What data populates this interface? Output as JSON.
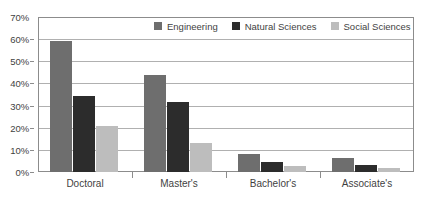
{
  "chart_data": {
    "type": "bar",
    "title": "",
    "subtitle": "",
    "xlabel": "",
    "ylabel": "",
    "categories": [
      "Doctoral",
      "Master's",
      "Bachelor's",
      "Associate's"
    ],
    "series": [
      {
        "name": "Engineering",
        "color": "#6e6e6e",
        "values": [
          59,
          44,
          8,
          6.5
        ]
      },
      {
        "name": "Natural Sciences",
        "color": "#2c2c2c",
        "values": [
          34.5,
          31.5,
          4.5,
          3
        ]
      },
      {
        "name": "Social Sciences",
        "color": "#bdbdbd",
        "values": [
          21,
          13,
          2.5,
          2
        ]
      }
    ],
    "ylim": [
      0,
      70
    ],
    "y_tick_values": [
      0,
      10,
      20,
      30,
      40,
      50,
      60,
      70
    ],
    "y_tick_labels": [
      "0%",
      "10%",
      "20%",
      "30%",
      "40%",
      "50%",
      "60%",
      "70%"
    ],
    "grid": true,
    "grid_axis": "y",
    "legend_position": "top-right-inside",
    "value_suffix": "%"
  }
}
